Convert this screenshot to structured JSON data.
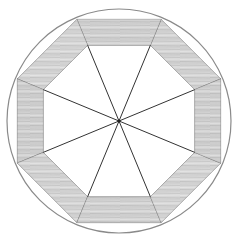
{
  "diagram": {
    "center": [
      119,
      121
    ],
    "circle_radius": 112,
    "outer_octagon_radius": 110,
    "inner_octagon_radius": 82,
    "sides": 8,
    "spokes": 8,
    "colors": {
      "background": "#ffffff",
      "circle_stroke": "#8a8a8a",
      "spoke_stroke": "#333333",
      "wood_light": "#e4e4e4",
      "wood_mid": "#c8c8c8",
      "wood_dark": "#9a9a9a",
      "segment_edge": "#555555"
    }
  }
}
